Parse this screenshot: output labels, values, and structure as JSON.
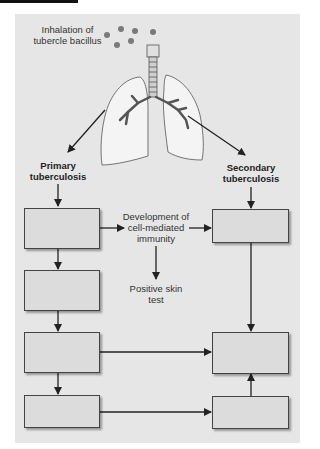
{
  "diagram": {
    "type": "flowchart",
    "top_label": {
      "line1": "Inhalation of",
      "line2": "tubercle bacillus"
    },
    "illustration": "lungs-with-trachea-and-bronchi",
    "branches": {
      "primary": {
        "line1": "Primary",
        "line2": "tuberculosis"
      },
      "secondary": {
        "line1": "Secondary",
        "line2": "tuberculosis"
      }
    },
    "middle": {
      "development": {
        "line1": "Development of",
        "line2": "cell-mediated",
        "line3": "immunity"
      },
      "skin_test": {
        "line1": "Positive skin",
        "line2": "test"
      }
    },
    "boxes": {
      "left": [
        "",
        "",
        "",
        ""
      ],
      "right": [
        "",
        "",
        ""
      ]
    },
    "colors": {
      "panel": "#e6e6e6",
      "box_fill": "#dcdcdc",
      "line": "#222222",
      "bacillus": "#7a7a7a"
    }
  }
}
